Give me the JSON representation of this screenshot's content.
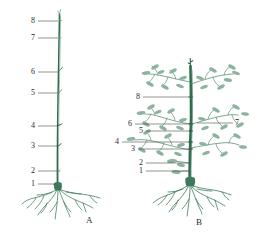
{
  "figure": {
    "title": "",
    "background": "#ffffff",
    "stem_color": "#2f6b4d",
    "leaf_color": "#6e9c84",
    "root_color": "#3d7a5c",
    "leader_color": "#4a4a48",
    "text_color": "#2b2b2b"
  },
  "panels": [
    {
      "id": "A",
      "letter": "A",
      "letter_pos": {
        "x": 86,
        "y": 216
      },
      "description": "tall unbranched plant",
      "callouts": [
        {
          "number": "8",
          "label_x": 31,
          "label_y": 17,
          "line_x1": 38,
          "line_x2": 58,
          "line_y": 21
        },
        {
          "number": "7",
          "label_x": 31,
          "label_y": 34,
          "line_x1": 38,
          "line_x2": 58,
          "line_y": 38
        },
        {
          "number": "6",
          "label_x": 31,
          "label_y": 68,
          "line_x1": 38,
          "line_x2": 58,
          "line_y": 72
        },
        {
          "number": "5",
          "label_x": 31,
          "label_y": 89,
          "line_x1": 38,
          "line_x2": 58,
          "line_y": 93
        },
        {
          "number": "4",
          "label_x": 31,
          "label_y": 122,
          "line_x1": 38,
          "line_x2": 58,
          "line_y": 126
        },
        {
          "number": "3",
          "label_x": 31,
          "label_y": 142,
          "line_x1": 38,
          "line_x2": 58,
          "line_y": 146
        },
        {
          "number": "2",
          "label_x": 31,
          "label_y": 167,
          "line_x1": 38,
          "line_x2": 58,
          "line_y": 171
        },
        {
          "number": "1",
          "label_x": 31,
          "label_y": 180,
          "line_x1": 38,
          "line_x2": 56,
          "line_y": 184
        }
      ]
    },
    {
      "id": "B",
      "letter": "B",
      "letter_pos": {
        "x": 196,
        "y": 218
      },
      "description": "branched leafy plant",
      "callouts": [
        {
          "number": "8",
          "label_x": 136,
          "label_y": 93,
          "line_x1": 143,
          "line_x2": 189,
          "line_y": 97
        },
        {
          "number": "7",
          "label_x": 235,
          "label_y": 119,
          "line_x1": 197,
          "line_x2": 233,
          "line_y": 123
        },
        {
          "number": "6",
          "label_x": 128,
          "label_y": 120,
          "line_x1": 135,
          "line_x2": 192,
          "line_y": 124
        },
        {
          "number": "5",
          "label_x": 139,
          "label_y": 127,
          "line_x1": 146,
          "line_x2": 192,
          "line_y": 131
        },
        {
          "number": "4",
          "label_x": 128,
          "label_y": 138,
          "line_x1": 122,
          "line_x2": 192,
          "line_y": 142
        },
        {
          "number": "3",
          "label_x": 131,
          "label_y": 145,
          "line_x1": 138,
          "line_x2": 192,
          "line_y": 149
        },
        {
          "number": "2",
          "label_x": 139,
          "label_y": 159,
          "line_x1": 146,
          "line_x2": 190,
          "line_y": 163
        },
        {
          "number": "1",
          "label_x": 139,
          "label_y": 167,
          "line_x1": 146,
          "line_x2": 190,
          "line_y": 171
        }
      ]
    }
  ]
}
